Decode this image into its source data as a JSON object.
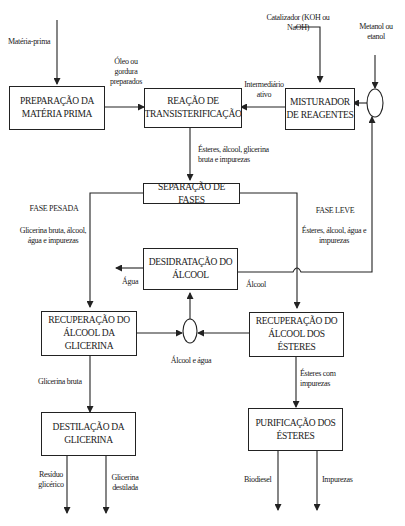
{
  "diagram": {
    "nodes": {
      "prep": "PREPARAÇÃO DA MATÉRIA PRIMA",
      "reacao": "REAÇÃO DE TRANSISTERIFICAÇÃO",
      "misturador": "MISTURADOR DE REAGENTES",
      "separacao": "SEPARAÇÃO DE FASES",
      "desidratacao": "DESIDRATAÇÃO DO ÁLCOOL",
      "rec_glicerina": "RECUPERAÇÃO DO ÁLCOOL DA GLICERINA",
      "rec_esteres": "RECUPERAÇÃO DO ÁLCOOL DOS ÉSTERES",
      "destilacao": "DESTILAÇÃO DA GLICERINA",
      "purificacao": "PURIFICAÇÃO DOS ÉSTERES"
    },
    "labels": {
      "materia_prima": "Matéria-prima",
      "oleo": "Óleo ou gordura preparados",
      "catalizador": "Catalizador (KOH ou NaOH)",
      "metanol": "Metanol ou etanol",
      "intermediario": "Intermediário ativo",
      "esteres_mix": "Ésteres, álcool, glicerina bruta e impurezas",
      "fase_pesada": "FASE PESADA",
      "fase_pesada_desc": "Glicerina bruta, álcool, água e impurezas",
      "fase_leve": "FASE LEVE",
      "fase_leve_desc": "Ésteres, álcool, água e impurezas",
      "agua": "Água",
      "alcool": "Álcool",
      "alcool_agua": "Álcool e água",
      "glicerina_bruta": "Glicerina bruta",
      "esteres_impurezas": "Ésteres com impurezas",
      "residuo": "Resíduo glicérico",
      "glicerina_destilada": "Glicerina destilada",
      "biodiesel": "Biodiesel",
      "impurezas": "Impurezas"
    }
  }
}
